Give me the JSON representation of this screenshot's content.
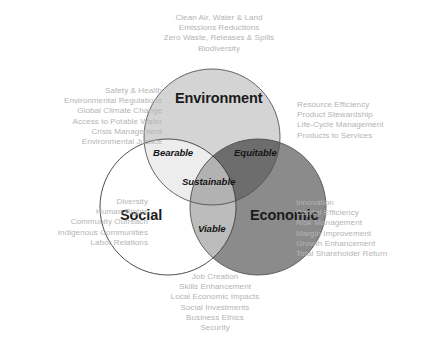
{
  "diagram": {
    "type": "venn-3-circle",
    "colors": {
      "background": "#ffffff",
      "environment_fill": "#d4d4d4",
      "social_fill": "#ffffff",
      "economic_fill": "#8b8b8b",
      "bearable_fill": "#ededed",
      "equitable_fill": "#6d6d6d",
      "viable_fill": "#bcbcbc",
      "sustainable_fill": "#b2b2b2",
      "outline": "#3a3a3a",
      "annotation_text": "#b4b4b4",
      "label_text": "#1b1b1b"
    },
    "circles": {
      "environment": {
        "label": "Environment",
        "cx": 212,
        "cy": 137,
        "r": 68
      },
      "social": {
        "label": "Social",
        "cx": 168,
        "cy": 207,
        "r": 68
      },
      "economic": {
        "label": "Economic",
        "cx": 258,
        "cy": 207,
        "r": 68
      }
    },
    "intersections": {
      "bearable": {
        "label": "Bearable",
        "of": "Environment + Social"
      },
      "equitable": {
        "label": "Equitable",
        "of": "Environment + Economic"
      },
      "viable": {
        "label": "Viable",
        "of": "Social + Economic"
      },
      "sustainable": {
        "label": "Sustainable",
        "of": "Environment + Social + Economic"
      }
    },
    "annotations": {
      "top": {
        "anchor": "environment",
        "lines": [
          "Clean Air, Water & Land",
          "Emissions Reductions",
          "Zero Waste, Releases & Spills",
          "Biodiversity"
        ]
      },
      "left_upper": {
        "anchor": "environment-social",
        "lines": [
          "Safety & Health",
          "Environmental Regulations",
          "Global Climate Change",
          "Access to Potable Water",
          "Crisis Management",
          "Environmental Justice"
        ]
      },
      "left_lower": {
        "anchor": "social",
        "lines": [
          "Diversity",
          "Human Rights",
          "Community Outreach",
          "Indigenous Communities",
          "Labor Relations"
        ]
      },
      "right_upper": {
        "anchor": "environment-economic",
        "lines": [
          "Resource Efficiency",
          "Product Stewardship",
          "Life-Cycle Management",
          "Products to Services"
        ]
      },
      "right_lower": {
        "anchor": "economic",
        "lines": [
          "Innovation",
          "Capital Efficiency",
          "Risk Management",
          "Margin Improvement",
          "Growth Enhancement",
          "Total Shareholder Return"
        ]
      },
      "bottom": {
        "anchor": "social-economic",
        "lines": [
          "Job Creation",
          "Skills Enhancement",
          "Local Economic Impacts",
          "Social Investments",
          "Business Ethics",
          "Security"
        ]
      }
    }
  }
}
